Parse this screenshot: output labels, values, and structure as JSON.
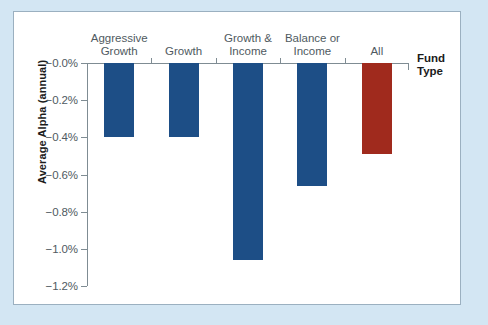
{
  "chart_data": {
    "type": "bar",
    "title": "",
    "xlabel": "Fund Type",
    "ylabel": "Average Alpha (annual)",
    "categories": [
      "Aggressive Growth",
      "Growth",
      "Growth & Income",
      "Balance or Income",
      "All"
    ],
    "category_lines": [
      [
        "Aggressive",
        "Growth"
      ],
      [
        "Growth"
      ],
      [
        "Growth &",
        "Income"
      ],
      [
        "Balance or",
        "Income"
      ],
      [
        "All"
      ]
    ],
    "values": [
      -0.4,
      -0.4,
      -1.06,
      -0.66,
      -0.49
    ],
    "bar_colors": [
      "#1d4e86",
      "#1d4e86",
      "#1d4e86",
      "#1d4e86",
      "#a02a1d"
    ],
    "ylim": [
      -1.2,
      0.0
    ],
    "yticks": [
      0.0,
      -0.2,
      -0.4,
      -0.6,
      -0.8,
      -1.0,
      -1.2
    ],
    "ytick_labels": [
      "−0.0%",
      "−0.2%",
      "−0.4%",
      "−0.6%",
      "−0.8%",
      "−1.0%",
      "−1.2%"
    ],
    "grid": false,
    "legend": null,
    "accent_blue": "#1d4e86",
    "accent_red": "#a02a1d",
    "page_background": "#d3e6f3",
    "plot_background": "#ffffff",
    "axis_color": "#7f8c93"
  }
}
